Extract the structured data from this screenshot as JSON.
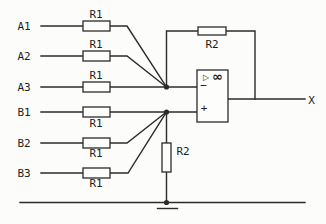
{
  "colors": {
    "background": "#fcfcfa",
    "stroke": "#2b2b2b",
    "text": "#1f1f1f",
    "component_fill": "#fdfdfc"
  },
  "rows": [
    {
      "input": "A1",
      "resistor": "R1"
    },
    {
      "input": "A2",
      "resistor": "R1"
    },
    {
      "input": "A3",
      "resistor": "R1"
    },
    {
      "input": "B1",
      "resistor": "R1"
    },
    {
      "input": "B2",
      "resistor": "R1"
    },
    {
      "input": "B3",
      "resistor": "R1"
    }
  ],
  "feedback_resistor": {
    "label": "R2"
  },
  "shunt_resistor": {
    "label": "R2"
  },
  "opamp": {
    "triangle_symbol": "▷",
    "gain_symbol": "∞",
    "inverting_label": "−",
    "noninverting_label": "+"
  },
  "output": {
    "label": "X"
  }
}
